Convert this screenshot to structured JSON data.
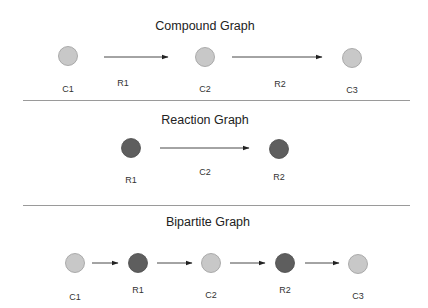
{
  "colors": {
    "compound_fill": "#c8c8c8",
    "compound_stroke": "#9c9c9c",
    "reaction_fill": "#5e5e5e",
    "reaction_stroke": "#4a4a4a",
    "edge": "#333333",
    "divider": "#9a9a9a"
  },
  "panels": [
    {
      "title": "Compound Graph",
      "title_pos": [
        205,
        30
      ],
      "nodes": [
        {
          "id": "C1",
          "type": "compound",
          "x": 68,
          "y": 56,
          "label": "C1",
          "lx": 68,
          "ly": 92
        },
        {
          "id": "C2",
          "type": "compound",
          "x": 205,
          "y": 57,
          "label": "C2",
          "lx": 205,
          "ly": 92
        },
        {
          "id": "C3",
          "type": "compound",
          "x": 352,
          "y": 58,
          "label": "C3",
          "lx": 352,
          "ly": 93
        }
      ],
      "edges": [
        {
          "x1": 104,
          "x2": 168,
          "y": 57,
          "label": "R1",
          "lx": 123,
          "ly": 86
        },
        {
          "x1": 232,
          "x2": 322,
          "y": 57,
          "label": "R2",
          "lx": 280,
          "ly": 87
        }
      ],
      "divider": {
        "x1": 23,
        "x2": 410,
        "y": 100
      }
    },
    {
      "title": "Reaction Graph",
      "title_pos": [
        205,
        124
      ],
      "nodes": [
        {
          "id": "R1",
          "type": "reaction",
          "x": 131,
          "y": 148,
          "label": "R1",
          "lx": 131,
          "ly": 183
        },
        {
          "id": "R2",
          "type": "reaction",
          "x": 279,
          "y": 149,
          "label": "R2",
          "lx": 279,
          "ly": 180
        }
      ],
      "edges": [
        {
          "x1": 160,
          "x2": 249,
          "y": 148,
          "label": "C2",
          "lx": 205,
          "ly": 175
        }
      ],
      "divider": {
        "x1": 23,
        "x2": 410,
        "y": 205
      }
    },
    {
      "title": "Bipartite Graph",
      "title_pos": [
        208,
        226
      ],
      "nodes": [
        {
          "id": "C1",
          "type": "compound",
          "x": 75,
          "y": 263,
          "label": "C1",
          "lx": 75,
          "ly": 300
        },
        {
          "id": "R1",
          "type": "reaction",
          "x": 138,
          "y": 263,
          "label": "R1",
          "lx": 138,
          "ly": 293
        },
        {
          "id": "C2",
          "type": "compound",
          "x": 211,
          "y": 263,
          "label": "C2",
          "lx": 211,
          "ly": 298
        },
        {
          "id": "R2",
          "type": "reaction",
          "x": 285,
          "y": 263,
          "label": "R2",
          "lx": 285,
          "ly": 293
        },
        {
          "id": "C3",
          "type": "compound",
          "x": 358,
          "y": 264,
          "label": "C3",
          "lx": 358,
          "ly": 299
        }
      ],
      "edges": [
        {
          "x1": 92,
          "x2": 118,
          "y": 263,
          "label": "",
          "lx": 0,
          "ly": 0
        },
        {
          "x1": 157,
          "x2": 192,
          "y": 263,
          "label": "",
          "lx": 0,
          "ly": 0
        },
        {
          "x1": 230,
          "x2": 265,
          "y": 263,
          "label": "",
          "lx": 0,
          "ly": 0
        },
        {
          "x1": 305,
          "x2": 339,
          "y": 263,
          "label": "",
          "lx": 0,
          "ly": 0
        }
      ],
      "divider": null
    }
  ]
}
